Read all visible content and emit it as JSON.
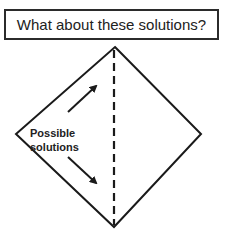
{
  "title": "What about these solutions?",
  "diagram": {
    "label_line1": "Possible",
    "label_line2": "solutions",
    "shape": "diamond",
    "divider": "dashed-vertical-line",
    "arrows": [
      "arrow-up-right",
      "arrow-down-right"
    ],
    "stroke_color": "#1a1a1a"
  }
}
